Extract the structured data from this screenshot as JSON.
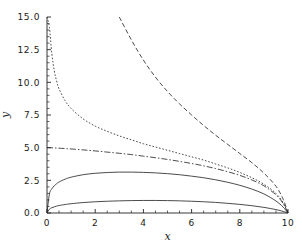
{
  "chart_data": {
    "type": "line",
    "title": "",
    "xlabel": "x",
    "ylabel": "y",
    "xlim": [
      0,
      10
    ],
    "ylim": [
      0,
      15
    ],
    "grid": false,
    "legend": "none",
    "x_ticks": [
      0,
      2,
      4,
      6,
      8,
      10
    ],
    "x_tick_labels": [
      "0",
      "2",
      "4",
      "6",
      "8",
      "10"
    ],
    "x_minor_tick_step": 0.5,
    "y_ticks": [
      0.0,
      2.5,
      5.0,
      7.5,
      10.0,
      12.5,
      15.0
    ],
    "y_tick_labels": [
      "0.0",
      "2.5",
      "5.0",
      "7.5",
      "10.0",
      "12.5",
      "15.0"
    ],
    "y_minor_tick_step": 0.5,
    "x": [
      0.0,
      0.1,
      0.2,
      0.3,
      0.4,
      0.5,
      0.75,
      1.0,
      1.5,
      2.0,
      2.5,
      3.0,
      3.5,
      4.0,
      4.5,
      5.0,
      5.5,
      6.0,
      6.5,
      7.0,
      7.5,
      8.0,
      8.5,
      9.0,
      9.5,
      9.8,
      10.0
    ],
    "series": [
      {
        "name": "curve-1-solid-low",
        "style": "solid",
        "dash": "none",
        "color": "#2b2b2b",
        "values": [
          0.0,
          0.29,
          0.4,
          0.47,
          0.53,
          0.57,
          0.65,
          0.71,
          0.8,
          0.86,
          0.9,
          0.93,
          0.95,
          0.96,
          0.96,
          0.95,
          0.93,
          0.9,
          0.86,
          0.81,
          0.74,
          0.66,
          0.56,
          0.43,
          0.26,
          0.12,
          0.0
        ]
      },
      {
        "name": "curve-2-solid-high",
        "style": "solid",
        "dash": "none",
        "color": "#2b2b2b",
        "values": [
          0.0,
          1.45,
          1.85,
          2.08,
          2.24,
          2.37,
          2.59,
          2.74,
          2.93,
          3.04,
          3.1,
          3.13,
          3.13,
          3.11,
          3.07,
          3.01,
          2.93,
          2.82,
          2.7,
          2.54,
          2.35,
          2.12,
          1.83,
          1.46,
          0.92,
          0.45,
          0.0
        ]
      },
      {
        "name": "curve-3-dashdot",
        "style": "dashdot",
        "dash": "6,2,1.5,2",
        "color": "#2b2b2b",
        "values": [
          5.0,
          5.0,
          4.99,
          4.98,
          4.97,
          4.96,
          4.93,
          4.9,
          4.83,
          4.75,
          4.66,
          4.57,
          4.47,
          4.35,
          4.23,
          4.1,
          3.95,
          3.79,
          3.61,
          3.4,
          3.16,
          2.88,
          2.53,
          2.08,
          1.39,
          0.72,
          0.0
        ]
      },
      {
        "name": "curve-4-dotted",
        "style": "dotted",
        "dash": "1.6,1.8",
        "color": "#2b2b2b",
        "values": [
          15.0,
          14.2,
          12.2,
          10.9,
          10.1,
          9.5,
          8.6,
          8.0,
          7.2,
          6.65,
          6.25,
          5.9,
          5.6,
          5.3,
          5.05,
          4.8,
          4.55,
          4.3,
          4.05,
          3.75,
          3.45,
          3.1,
          2.7,
          2.2,
          1.5,
          0.78,
          0.0
        ]
      },
      {
        "name": "curve-5-longdash",
        "style": "dashed",
        "dash": "4.5,2.5",
        "color": "#2b2b2b",
        "x_start": 3.2,
        "values": [
          null,
          null,
          null,
          null,
          null,
          null,
          null,
          null,
          null,
          null,
          null,
          15.0,
          13.25,
          11.7,
          10.4,
          9.3,
          8.35,
          7.5,
          6.7,
          5.95,
          5.25,
          4.55,
          3.85,
          3.05,
          2.05,
          1.05,
          0.0
        ]
      }
    ]
  },
  "axes": {
    "x_title": "x",
    "y_title": "y"
  }
}
